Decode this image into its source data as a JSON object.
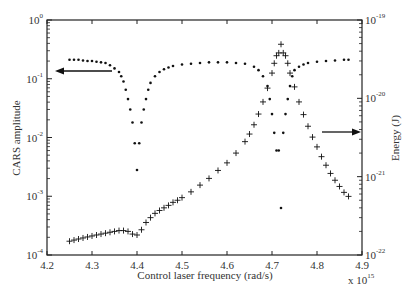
{
  "chart_data": {
    "type": "scatter",
    "title": "",
    "xlabel": "Control laser frequency (rad/s)",
    "x_multiplier": "x 10^15",
    "ylabel_left": "CARS amplitude",
    "ylabel_right": "Energy (J)",
    "xlim": [
      4.2,
      4.9
    ],
    "ylim_left": [
      0.0001,
      1
    ],
    "ylim_right": [
      1e-22,
      1e-19
    ],
    "yscale_left": "log",
    "yscale_right": "log",
    "grid": false,
    "x_ticks": [
      "4.2",
      "4.3",
      "4.4",
      "4.5",
      "4.6",
      "4.7",
      "4.8",
      "4.9"
    ],
    "y_ticks_left": [
      {
        "base": "10",
        "exp": "0"
      },
      {
        "base": "10",
        "exp": "-1"
      },
      {
        "base": "10",
        "exp": "-2"
      },
      {
        "base": "10",
        "exp": "-3"
      },
      {
        "base": "10",
        "exp": "-4"
      }
    ],
    "y_ticks_right": [
      {
        "base": "10",
        "exp": "-19"
      },
      {
        "base": "10",
        "exp": "-20"
      },
      {
        "base": "10",
        "exp": "-21"
      },
      {
        "base": "10",
        "exp": "-22"
      }
    ],
    "annotations": [
      {
        "type": "arrow",
        "direction": "left",
        "meaning": "CARS amplitude (dots) refers to left axis"
      },
      {
        "type": "arrow",
        "direction": "right",
        "meaning": "Energy (plus markers) refers to right axis"
      }
    ],
    "series": [
      {
        "name": "CARS amplitude",
        "marker": "dot",
        "axis": "left",
        "x": [
          4.25,
          4.26,
          4.27,
          4.28,
          4.29,
          4.3,
          4.31,
          4.32,
          4.33,
          4.34,
          4.35,
          4.36,
          4.365,
          4.37,
          4.375,
          4.38,
          4.385,
          4.39,
          4.395,
          4.4,
          4.405,
          4.41,
          4.415,
          4.42,
          4.425,
          4.43,
          4.44,
          4.45,
          4.46,
          4.47,
          4.48,
          4.5,
          4.52,
          4.54,
          4.56,
          4.58,
          4.6,
          4.62,
          4.64,
          4.66,
          4.67,
          4.68,
          4.69,
          4.695,
          4.7,
          4.705,
          4.71,
          4.715,
          4.72,
          4.725,
          4.73,
          4.735,
          4.74,
          4.745,
          4.75,
          4.76,
          4.77,
          4.78,
          4.8,
          4.82,
          4.84,
          4.86,
          4.87
        ],
        "y": [
          0.21,
          0.21,
          0.21,
          0.205,
          0.2,
          0.2,
          0.195,
          0.19,
          0.185,
          0.17,
          0.15,
          0.13,
          0.11,
          0.09,
          0.065,
          0.045,
          0.03,
          0.018,
          0.008,
          0.0028,
          0.008,
          0.018,
          0.03,
          0.045,
          0.065,
          0.085,
          0.11,
          0.13,
          0.145,
          0.155,
          0.165,
          0.175,
          0.18,
          0.185,
          0.19,
          0.19,
          0.19,
          0.185,
          0.18,
          0.16,
          0.14,
          0.11,
          0.075,
          0.045,
          0.025,
          0.012,
          0.006,
          0.006,
          0.00063,
          0.012,
          0.025,
          0.045,
          0.075,
          0.11,
          0.14,
          0.16,
          0.175,
          0.185,
          0.195,
          0.2,
          0.205,
          0.21,
          0.21
        ]
      },
      {
        "name": "Energy",
        "marker": "plus",
        "axis": "right",
        "x": [
          4.25,
          4.26,
          4.27,
          4.28,
          4.29,
          4.3,
          4.31,
          4.32,
          4.33,
          4.34,
          4.35,
          4.36,
          4.37,
          4.38,
          4.39,
          4.4,
          4.41,
          4.42,
          4.43,
          4.44,
          4.45,
          4.46,
          4.47,
          4.48,
          4.49,
          4.5,
          4.52,
          4.54,
          4.56,
          4.58,
          4.6,
          4.62,
          4.64,
          4.65,
          4.66,
          4.67,
          4.68,
          4.69,
          4.7,
          4.705,
          4.71,
          4.715,
          4.72,
          4.725,
          4.73,
          4.735,
          4.74,
          4.75,
          4.76,
          4.77,
          4.78,
          4.79,
          4.8,
          4.81,
          4.82,
          4.83,
          4.84,
          4.85,
          4.86,
          4.87
        ],
        "y": [
          1.5e-22,
          1.55e-22,
          1.6e-22,
          1.65e-22,
          1.7e-22,
          1.75e-22,
          1.8e-22,
          1.85e-22,
          1.9e-22,
          1.95e-22,
          2e-22,
          2.05e-22,
          2.05e-22,
          2e-22,
          1.85e-22,
          1.8e-22,
          2.1e-22,
          2.6e-22,
          3e-22,
          3.4e-22,
          3.7e-22,
          4e-22,
          4.3e-22,
          4.7e-22,
          5e-22,
          5.4e-22,
          6.4e-22,
          7.8e-22,
          9.5e-22,
          1.2e-21,
          1.5e-21,
          2e-21,
          2.8e-21,
          3.5e-21,
          4.6e-21,
          6.3e-21,
          9e-21,
          1.35e-20,
          2.1e-20,
          2.8e-20,
          3.5e-20,
          3.8e-20,
          4.9e-20,
          3.8e-20,
          3.5e-20,
          2.8e-20,
          2.1e-20,
          1.4e-20,
          9e-21,
          6.2e-21,
          4.4e-21,
          3.2e-21,
          2.4e-21,
          1.8e-21,
          1.4e-21,
          1.1e-21,
          9e-22,
          7.5e-22,
          6.3e-22,
          5.6e-22
        ]
      }
    ]
  }
}
